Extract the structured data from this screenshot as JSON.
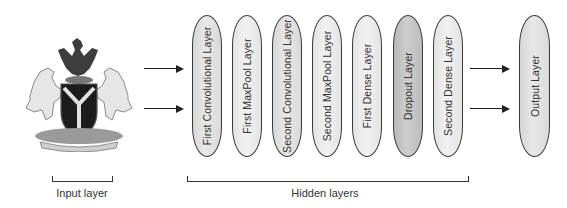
{
  "diagram": {
    "input": {
      "image_icon": "nigeria-coat-of-arms-icon",
      "label": "Input layer"
    },
    "hidden": {
      "label": "Hidden layers",
      "layers": [
        {
          "label": "First Convolutional Layer",
          "fill": "#dcdcdc"
        },
        {
          "label": "First MaxPool Layer",
          "fill": "#e9e9e9"
        },
        {
          "label": "Second Convolutional Layer",
          "fill": "#d6d6d6"
        },
        {
          "label": "Second MaxPool Layer",
          "fill": "#e6e6e6"
        },
        {
          "label": "First Dense Layer",
          "fill": "#e6e6e6"
        },
        {
          "label": "Dropout Layer",
          "fill": "#c4c4c4"
        },
        {
          "label": "Second Dense Layer",
          "fill": "#e2e2e2"
        }
      ]
    },
    "output": {
      "label": "Output Layer",
      "fill": "#d4d4d4"
    },
    "arrows": {
      "count_in": 2,
      "count_out": 2,
      "color": "#222222"
    }
  }
}
